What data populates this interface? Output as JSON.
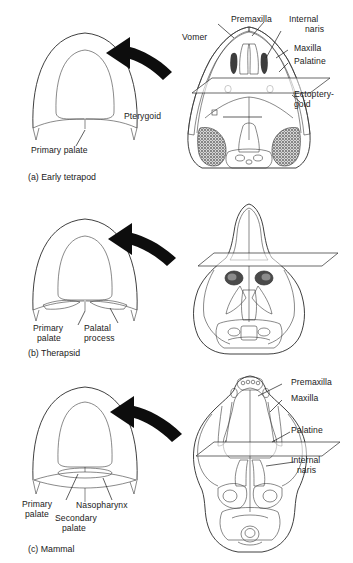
{
  "figure": {
    "type": "anatomical-comparative-diagram",
    "panel_count": 3
  },
  "panels": [
    {
      "id": "a",
      "caption": "(a) Early tetrapod",
      "cross_section": {
        "labels": [
          {
            "text": "Primary palate",
            "name": "primary-palate"
          }
        ]
      },
      "skull": {
        "view": "ventral",
        "labels": [
          {
            "text": "Vomer",
            "name": "vomer"
          },
          {
            "text": "Premaxilla",
            "name": "premaxilla"
          },
          {
            "text": "Internal",
            "name": "internal-naris-line1"
          },
          {
            "text": "naris",
            "name": "internal-naris-line2"
          },
          {
            "text": "Maxilla",
            "name": "maxilla"
          },
          {
            "text": "Palatine",
            "name": "palatine"
          },
          {
            "text": "Ectoptery-",
            "name": "ectopterygoid-line1"
          },
          {
            "text": "goid",
            "name": "ectopterygoid-line2"
          },
          {
            "text": "Pterygoid",
            "name": "pterygoid"
          }
        ]
      }
    },
    {
      "id": "b",
      "caption": "(b) Therapsid",
      "cross_section": {
        "labels": [
          {
            "text": "Primary",
            "name": "primary-palate-line1"
          },
          {
            "text": "palate",
            "name": "primary-palate-line2"
          },
          {
            "text": "Palatal",
            "name": "palatal-process-line1"
          },
          {
            "text": "process",
            "name": "palatal-process-line2"
          }
        ]
      },
      "skull": {
        "view": "ventral",
        "labels": []
      }
    },
    {
      "id": "c",
      "caption": "(c) Mammal",
      "cross_section": {
        "labels": [
          {
            "text": "Primary",
            "name": "primary-palate-line1"
          },
          {
            "text": "palate",
            "name": "primary-palate-line2"
          },
          {
            "text": "Nasopharynx",
            "name": "nasopharynx"
          },
          {
            "text": "Secondary",
            "name": "secondary-palate-line1"
          },
          {
            "text": "palate",
            "name": "secondary-palate-line2"
          }
        ]
      },
      "skull": {
        "view": "ventral",
        "labels": [
          {
            "text": "Premaxilla",
            "name": "premaxilla"
          },
          {
            "text": "Maxilla",
            "name": "maxilla"
          },
          {
            "text": "Palatine",
            "name": "palatine"
          },
          {
            "text": "Internal",
            "name": "internal-naris-line1"
          },
          {
            "text": "naris",
            "name": "internal-naris-line2"
          }
        ]
      }
    }
  ],
  "colors": {
    "background": "#ffffff",
    "ink": "#1a1a1a",
    "arrow": "#0d0d0d",
    "shading_dark": "#5a5a5a",
    "shading_light": "#cfcfcf"
  }
}
